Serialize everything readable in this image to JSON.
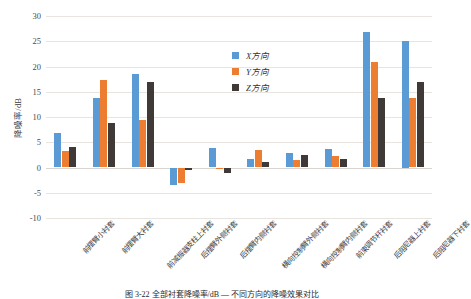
{
  "figure": {
    "caption": "图 3-22   全部衬套降噪率/dB — 不同方向的降噪效果对比"
  },
  "legend": {
    "position": "inside-top-right",
    "items": [
      {
        "label": "X方向",
        "color": "#5b9bd5"
      },
      {
        "label": "Y方向",
        "color": "#ed7d31"
      },
      {
        "label": "Z方向",
        "color": "#3f3a38"
      }
    ]
  },
  "chart_data": {
    "type": "bar",
    "title": "",
    "xlabel": "",
    "ylabel": "降噪率/dB",
    "ylim": [
      -10,
      30
    ],
    "ytick_step": 5,
    "yticks": [
      30,
      25,
      20,
      15,
      10,
      5,
      0,
      -5,
      -10
    ],
    "grid": true,
    "categories": [
      "前摆臂小衬套",
      "前摆臂大衬套",
      "前减振器支柱上衬套",
      "后摆臂外侧衬套",
      "后摆臂内侧衬套",
      "横向控制臂外侧衬套",
      "横向控制臂内侧衬套",
      "前束调节杆衬套",
      "后阻尼器上衬套",
      "后阻尼器下衬套"
    ],
    "series": [
      {
        "name": "X方向",
        "color": "#5b9bd5",
        "values": [
          6.9,
          13.8,
          18.5,
          -3.5,
          3.9,
          1.7,
          2.9,
          3.7,
          26.8,
          25.0
        ]
      },
      {
        "name": "Y方向",
        "color": "#ed7d31",
        "values": [
          3.3,
          17.4,
          9.4,
          -3.0,
          -0.2,
          3.4,
          1.5,
          2.2,
          20.8,
          13.7
        ]
      },
      {
        "name": "Z方向",
        "color": "#3f3a38",
        "values": [
          4.0,
          8.9,
          16.9,
          -0.5,
          -1.0,
          1.0,
          2.4,
          1.6,
          13.8,
          16.9
        ]
      }
    ]
  }
}
